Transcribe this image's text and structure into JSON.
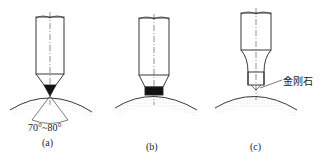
{
  "figures": [
    {
      "id": "a",
      "caption": "(a)",
      "angle_label": "70°~80°",
      "tip": "conical"
    },
    {
      "id": "b",
      "caption": "(b)",
      "tip": "flat"
    },
    {
      "id": "c",
      "caption": "(c)",
      "tip": "diamond",
      "callout": "金刚石"
    }
  ],
  "colors": {
    "line": "#222222",
    "fill": "#111111",
    "stipple": "#999999"
  }
}
